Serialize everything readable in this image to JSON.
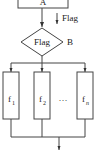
{
  "diagram": {
    "type": "flowchart",
    "nodes": {
      "top_box": {
        "label": "A"
      },
      "decision": {
        "label": "Flag",
        "side_label": "B"
      },
      "branches": [
        {
          "label": "f",
          "sub": "1"
        },
        {
          "label": "f",
          "sub": "2"
        },
        {
          "label": "f",
          "sub": "n"
        }
      ],
      "ellipsis": "…"
    },
    "edges": {
      "flag_arrow_label": "Flag"
    },
    "colors": {
      "stroke": "#444444",
      "text": "#222222",
      "background": "#ffffff"
    }
  }
}
